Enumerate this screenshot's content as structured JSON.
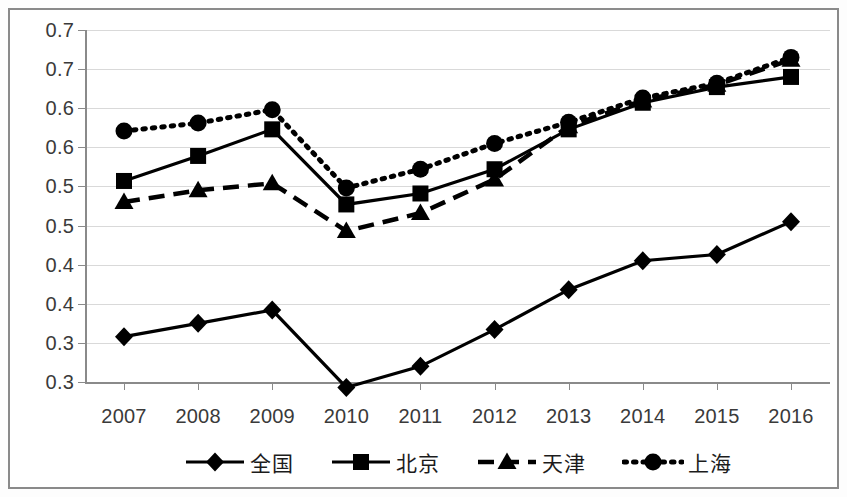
{
  "chart_data": {
    "type": "line",
    "title": "",
    "subtitle": "",
    "xlabel": "",
    "ylabel": "",
    "categories": [
      "2007",
      "2008",
      "2009",
      "2010",
      "2011",
      "2012",
      "2013",
      "2014",
      "2015",
      "2016"
    ],
    "ylim": [
      0.3,
      0.75
    ],
    "ytick_values": [
      0.75,
      0.7,
      0.65,
      0.6,
      0.55,
      0.5,
      0.45,
      0.4,
      0.35,
      0.3
    ],
    "ytick_labels": [
      "0.7",
      "0.7",
      "0.6",
      "0.6",
      "0.5",
      "0.5",
      "0.4",
      "0.4",
      "0.3",
      "0.3"
    ],
    "grid": true,
    "legend_position": "bottom",
    "series": [
      {
        "name": "全国",
        "marker": "diamond",
        "line_style": "solid",
        "color": "#000000",
        "values": [
          0.358,
          0.375,
          0.392,
          0.293,
          0.32,
          0.367,
          0.418,
          0.455,
          0.463,
          0.505
        ]
      },
      {
        "name": "北京",
        "marker": "square",
        "line_style": "solid",
        "color": "#000000",
        "values": [
          0.557,
          0.589,
          0.623,
          0.527,
          0.541,
          0.572,
          0.623,
          0.657,
          0.677,
          0.69
        ]
      },
      {
        "name": "天津",
        "marker": "triangle",
        "line_style": "dashed",
        "color": "#000000",
        "values": [
          0.53,
          0.545,
          0.554,
          0.493,
          0.516,
          0.559,
          0.627,
          0.66,
          0.68,
          0.712
        ]
      },
      {
        "name": "上海",
        "marker": "circle",
        "line_style": "dotted",
        "color": "#000000",
        "values": [
          0.621,
          0.631,
          0.648,
          0.548,
          0.572,
          0.605,
          0.632,
          0.663,
          0.682,
          0.715
        ]
      }
    ]
  },
  "legend": {
    "items": [
      {
        "label": "全国",
        "marker": "diamond",
        "line_style": "solid"
      },
      {
        "label": "北京",
        "marker": "square",
        "line_style": "solid"
      },
      {
        "label": "天津",
        "marker": "triangle",
        "line_style": "dashed"
      },
      {
        "label": "上海",
        "marker": "circle",
        "line_style": "dotted"
      }
    ]
  },
  "axis_colors": {
    "axis_line": "#8a8a8a",
    "gridline": "#d9d9d9",
    "tick_text": "#3a3a3a",
    "series": "#000000"
  }
}
